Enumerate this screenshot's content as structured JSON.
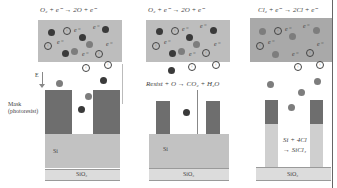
{
  "panels": [
    {
      "id": "oxygen-plasma-physical",
      "equation": "O₂ + e⁻ → 2O + e⁻",
      "substrate_label": "Si",
      "base_label": "SiO₂",
      "field_label": "E",
      "mask_label_line1": "Mask",
      "mask_label_line2": "(photoresist)"
    },
    {
      "id": "oxygen-plasma-resist-ashing",
      "equation": "O₂ + e⁻ → 2O + e⁻",
      "reaction_label": "Resist + O → CO₂ + H₂O",
      "substrate_label": "Si",
      "base_label": "SiO₂"
    },
    {
      "id": "chlorine-plasma-etch",
      "equation": "Cl₂ + e⁻ → 2Cl + e⁻",
      "reaction_line1": "Si + 4Cl",
      "reaction_line2": "→ SiCl₄",
      "base_label": "SiO₂"
    }
  ],
  "symbols": {
    "ion": "+",
    "electron": "e⁻"
  },
  "colors": {
    "plasma": "#bdbdbd",
    "plasma_cl": "#a9a9a9",
    "mask": "#6e6e6e",
    "silicon": "#c2c2c2",
    "sio2": "#dcdcdc"
  }
}
